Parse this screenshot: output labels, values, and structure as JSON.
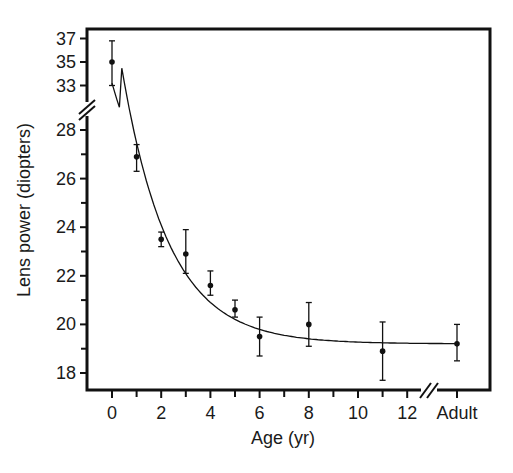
{
  "chart_data": {
    "type": "scatter",
    "title": "",
    "xlabel": "Age (yr)",
    "ylabel": "Lens power (diopters)",
    "x_ticks": [
      "0",
      "2",
      "4",
      "6",
      "8",
      "10",
      "12",
      "Adult"
    ],
    "y_ticks_lower": [
      "18",
      "20",
      "22",
      "24",
      "26",
      "28"
    ],
    "y_ticks_upper": [
      "33",
      "35",
      "37"
    ],
    "y_axis_break": true,
    "x_axis_break": true,
    "grid": false,
    "legend": null,
    "series": [
      {
        "name": "Measured lens power",
        "points": [
          {
            "x": "0",
            "y": 35.0,
            "err_low": 33.0,
            "err_high": 36.8
          },
          {
            "x": "1",
            "y": 26.9,
            "err_low": 26.3,
            "err_high": 27.4
          },
          {
            "x": "2",
            "y": 23.5,
            "err_low": 23.2,
            "err_high": 23.8
          },
          {
            "x": "3",
            "y": 22.9,
            "err_low": 22.1,
            "err_high": 23.9
          },
          {
            "x": "4",
            "y": 21.6,
            "err_low": 21.2,
            "err_high": 22.2
          },
          {
            "x": "5",
            "y": 20.6,
            "err_low": 20.3,
            "err_high": 21.0
          },
          {
            "x": "6",
            "y": 19.5,
            "err_low": 18.7,
            "err_high": 20.3
          },
          {
            "x": "8",
            "y": 20.0,
            "err_low": 19.1,
            "err_high": 20.9
          },
          {
            "x": "11",
            "y": 18.9,
            "err_low": 17.7,
            "err_high": 20.1
          },
          {
            "x": "Adult",
            "y": 19.2,
            "err_low": 18.5,
            "err_high": 20.0
          }
        ]
      },
      {
        "name": "Exponential fit",
        "type": "line",
        "description": "Smooth decaying curve from ~33 D at age 0 approaching ~19.2 D asymptote"
      }
    ]
  }
}
